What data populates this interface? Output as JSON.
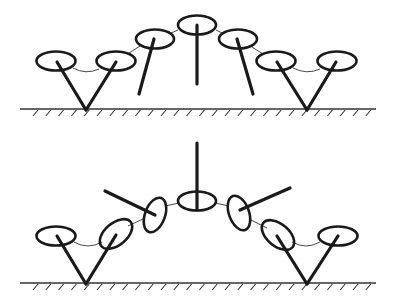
{
  "diagram": {
    "title": "",
    "figures": [
      {
        "id": "upper-configuration",
        "ground": "hatched-line",
        "joint_count": 7,
        "arc_shape": "arched upward, all joints horizontal ellipses",
        "legs": [
          "v-pair-left",
          "tilted-left",
          "vertical-center",
          "tilted-right",
          "v-pair-right"
        ]
      },
      {
        "id": "lower-configuration",
        "ground": "hatched-line",
        "joint_count": 7,
        "arc_shape": "arched upward, inner joints tilted, inner legs extended outward",
        "legs": [
          "v-pair-left",
          "outward-left",
          "vertical-center",
          "outward-right",
          "v-pair-right"
        ]
      }
    ],
    "colors": {
      "stroke": "#1a1a1a",
      "background": "#ffffff"
    }
  }
}
